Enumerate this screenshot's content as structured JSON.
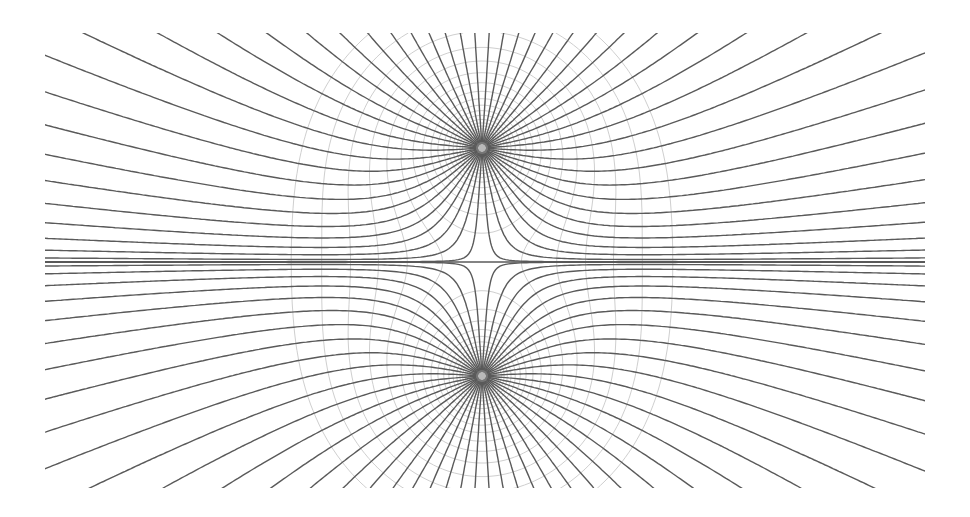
{
  "diagram": {
    "type": "field-lines",
    "plot_region": {
      "x0": 45,
      "y0": 33,
      "x1": 925,
      "y1": 488
    },
    "charges": [
      {
        "id": "upper",
        "x": 482,
        "y": 148,
        "q": 1
      },
      {
        "id": "lower",
        "x": 482,
        "y": 376,
        "q": 1
      }
    ],
    "symmetry_axis_y": 262,
    "field_lines_per_charge": 48,
    "equipotential_levels": 22,
    "colors": {
      "background": "#ffffff",
      "field_line": "#5a5a5a",
      "equipotential": "#cfcfcf"
    }
  }
}
